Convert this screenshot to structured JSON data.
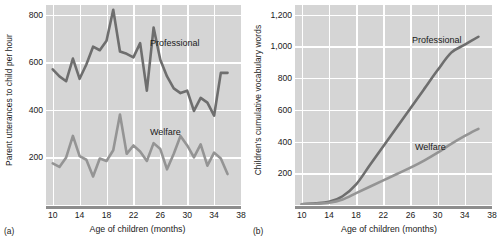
{
  "figure": {
    "panels": [
      {
        "tag": "(a)",
        "ylabel": "Parent utterances to child per hour",
        "xlabel": "Age of children (months)",
        "series_labels": {
          "professional": "Professional",
          "welfare": "Welfare"
        }
      },
      {
        "tag": "(b)",
        "ylabel": "Children's cumulative vocabulary words",
        "xlabel": "Age of children (months)",
        "series_labels": {
          "professional": "Professional",
          "welfare": "Welfare"
        }
      }
    ]
  },
  "colors": {
    "plot_background": "#d5d5d5",
    "gridline": "#ffffff",
    "professional_line": "#6e6e6e",
    "welfare_line": "#949494",
    "axis": "#8d8d8d",
    "text": "#1a1a1a"
  },
  "chart_data": [
    {
      "type": "line",
      "title": "",
      "panel": "(a)",
      "xlabel": "Age of children (months)",
      "ylabel": "Parent utterances to child per hour",
      "xlim": [
        9,
        38
      ],
      "ylim": [
        0,
        840
      ],
      "xticks": [
        10,
        14,
        18,
        22,
        26,
        30,
        34,
        38
      ],
      "yticks": [
        200,
        400,
        600,
        800
      ],
      "ytick_labels": [
        "200",
        "400",
        "600",
        "800"
      ],
      "grid": true,
      "legend": "inline-annotations",
      "x": [
        10,
        11,
        12,
        13,
        14,
        15,
        16,
        17,
        18,
        19,
        20,
        21,
        22,
        23,
        24,
        25,
        26,
        27,
        28,
        29,
        30,
        31,
        32,
        33,
        34,
        35,
        36
      ],
      "series": [
        {
          "name": "Professional",
          "values": [
            570,
            540,
            520,
            615,
            530,
            590,
            665,
            650,
            690,
            820,
            645,
            635,
            620,
            680,
            480,
            745,
            610,
            540,
            490,
            470,
            480,
            395,
            450,
            430,
            375,
            555,
            555
          ]
        },
        {
          "name": "Welfare",
          "values": [
            175,
            160,
            200,
            290,
            205,
            190,
            120,
            195,
            185,
            230,
            380,
            215,
            250,
            225,
            185,
            260,
            235,
            150,
            215,
            290,
            250,
            200,
            255,
            165,
            220,
            195,
            130
          ]
        }
      ]
    },
    {
      "type": "line",
      "title": "",
      "panel": "(b)",
      "xlabel": "Age of children (months)",
      "ylabel": "Children's cumulative vocabulary words",
      "xlim": [
        9,
        38
      ],
      "ylim": [
        0,
        1260
      ],
      "xticks": [
        10,
        14,
        18,
        22,
        26,
        30,
        34,
        38
      ],
      "yticks": [
        200,
        400,
        600,
        800,
        1000,
        1200
      ],
      "ytick_labels": [
        "200",
        "400",
        "600",
        "800",
        "1,000",
        "1,200"
      ],
      "grid": true,
      "legend": "inline-annotations",
      "x": [
        10,
        12,
        14,
        16,
        18,
        20,
        22,
        24,
        26,
        28,
        30,
        32,
        34,
        36
      ],
      "series": [
        {
          "name": "Professional",
          "values": [
            5,
            10,
            20,
            55,
            130,
            250,
            370,
            490,
            610,
            730,
            850,
            960,
            1010,
            1060
          ]
        },
        {
          "name": "Welfare",
          "values": [
            5,
            8,
            14,
            35,
            75,
            115,
            155,
            195,
            235,
            280,
            330,
            385,
            435,
            480
          ]
        }
      ]
    }
  ]
}
